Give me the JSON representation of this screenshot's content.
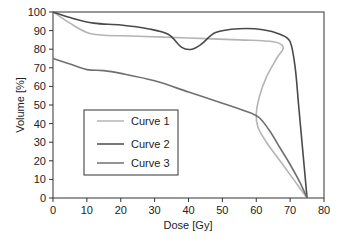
{
  "chart_data": {
    "type": "line",
    "title": "",
    "xlabel": "Dose [Gy]",
    "ylabel": "Volume [%]",
    "xlim": [
      0,
      80
    ],
    "ylim": [
      0,
      100
    ],
    "xticks": [
      0,
      10,
      20,
      30,
      40,
      50,
      60,
      70,
      80
    ],
    "yticks": [
      0,
      10,
      20,
      30,
      40,
      50,
      60,
      70,
      80,
      90,
      100
    ],
    "grid": false,
    "legend_position": "inside lower-left",
    "series": [
      {
        "name": "Curve 1",
        "color": "#b4b4b4",
        "points": [
          [
            0,
            100
          ],
          [
            5,
            94
          ],
          [
            10,
            89
          ],
          [
            15,
            87.5
          ],
          [
            25,
            87
          ],
          [
            40,
            86
          ],
          [
            55,
            85
          ],
          [
            65,
            84
          ],
          [
            68,
            81
          ],
          [
            66,
            75
          ],
          [
            63,
            65
          ],
          [
            61,
            55
          ],
          [
            60,
            45
          ],
          [
            60.5,
            38
          ],
          [
            63,
            30
          ],
          [
            67,
            20
          ],
          [
            71,
            10
          ],
          [
            75,
            0
          ]
        ]
      },
      {
        "name": "Curve 2",
        "color": "#4a4a4a",
        "points": [
          [
            0,
            100
          ],
          [
            5,
            97
          ],
          [
            12,
            94
          ],
          [
            20,
            93
          ],
          [
            28,
            91
          ],
          [
            34,
            88
          ],
          [
            38,
            81
          ],
          [
            41,
            80
          ],
          [
            44,
            83
          ],
          [
            48,
            89
          ],
          [
            55,
            91
          ],
          [
            62,
            90.5
          ],
          [
            67,
            88
          ],
          [
            70,
            84
          ],
          [
            71.5,
            70
          ],
          [
            72.5,
            50
          ],
          [
            73.5,
            30
          ],
          [
            74.5,
            10
          ],
          [
            75,
            0
          ]
        ]
      },
      {
        "name": "Curve 3",
        "color": "#707070",
        "points": [
          [
            0,
            75
          ],
          [
            5,
            72
          ],
          [
            10,
            69
          ],
          [
            15,
            68.5
          ],
          [
            20,
            67
          ],
          [
            30,
            63
          ],
          [
            40,
            57
          ],
          [
            50,
            51
          ],
          [
            58,
            46
          ],
          [
            61,
            43
          ],
          [
            64,
            36
          ],
          [
            67,
            27
          ],
          [
            70,
            18
          ],
          [
            73,
            8
          ],
          [
            75,
            0
          ]
        ]
      }
    ]
  },
  "legend": {
    "items": [
      "Curve 1",
      "Curve 2",
      "Curve 3"
    ]
  }
}
